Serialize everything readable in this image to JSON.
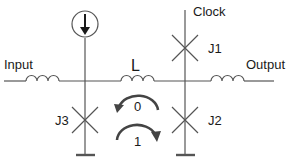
{
  "diagram": {
    "type": "circuit-schematic",
    "labels": {
      "input": "Input",
      "output": "Output",
      "clock": "Clock",
      "inductor_main": "L",
      "junction_1": "J1",
      "junction_2": "J2",
      "junction_3": "J3",
      "state_0": "0",
      "state_1": "1"
    },
    "components": [
      {
        "id": "input-inductor",
        "kind": "inductor"
      },
      {
        "id": "L",
        "kind": "inductor"
      },
      {
        "id": "output-inductor",
        "kind": "inductor"
      },
      {
        "id": "bias-current-source",
        "kind": "current-source",
        "direction": "down"
      },
      {
        "id": "J1",
        "kind": "josephson-junction"
      },
      {
        "id": "J2",
        "kind": "josephson-junction"
      },
      {
        "id": "J3",
        "kind": "josephson-junction"
      },
      {
        "id": "ground-left",
        "kind": "ground"
      },
      {
        "id": "ground-right",
        "kind": "ground"
      }
    ],
    "annotations": [
      {
        "id": "state-0-arrow",
        "kind": "curved-arrow",
        "direction": "counter-clockwise",
        "label": "0"
      },
      {
        "id": "state-1-arrow",
        "kind": "curved-arrow",
        "direction": "clockwise",
        "label": "1"
      }
    ],
    "colors": {
      "line": "#555555",
      "arrow": "#444444",
      "text": "#1a1a1a"
    }
  }
}
